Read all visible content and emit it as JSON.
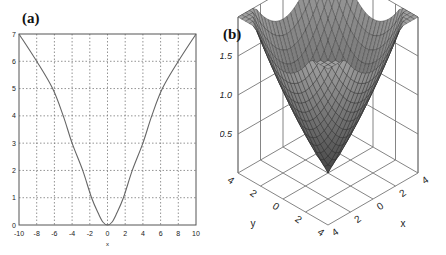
{
  "chart_data": [
    {
      "panel_label": "(a)",
      "type": "line",
      "title": "",
      "xlabel": "x",
      "ylabel": "",
      "xlim": [
        -10,
        10
      ],
      "ylim": [
        0,
        7
      ],
      "grid": true,
      "xticks": [
        -10,
        -8,
        -6,
        -4,
        -2,
        0,
        2,
        4,
        6,
        8,
        10
      ],
      "yticks": [
        0,
        1,
        2,
        3,
        4,
        5,
        6,
        7
      ],
      "series": [
        {
          "name": "curve",
          "x": [
            -10,
            -8,
            -6.2,
            -5,
            -4,
            -2.8,
            -1.8,
            -1,
            -0.5,
            0,
            0.5,
            1,
            1.8,
            2.8,
            4,
            5,
            6.2,
            8,
            10
          ],
          "y": [
            7,
            6,
            5,
            4,
            3,
            2,
            1,
            0.4,
            0.1,
            0,
            0.1,
            0.4,
            1,
            2,
            3,
            4,
            5,
            6,
            7
          ]
        }
      ]
    },
    {
      "panel_label": "(b)",
      "type": "surface",
      "title": "",
      "xlabel": "x",
      "ylabel": "y",
      "zlabel": "",
      "xlim": [
        -4,
        4
      ],
      "ylim": [
        -4,
        4
      ],
      "zlim": [
        0,
        2
      ],
      "xticks": [
        "-4",
        "-2",
        "0",
        "2",
        "4"
      ],
      "yticks": [
        "-4",
        "-2",
        "0",
        "2",
        "4"
      ],
      "zticks": [
        "0.5",
        "1.0",
        "1.5"
      ],
      "grid": true,
      "description": "Bowl-shaped surface with minimum ~0 at origin, rising to ~1.4 at edge midpoints and ~1.9 at corners"
    }
  ],
  "panels": {
    "a": {
      "label": "(a)",
      "xlabel": "x"
    },
    "b": {
      "label": "(b)",
      "xlabel": "x",
      "ylabel": "y"
    }
  }
}
